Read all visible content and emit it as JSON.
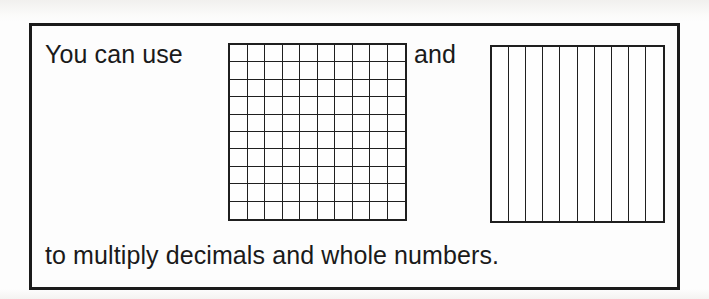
{
  "page": {
    "background_color": "#fdfdfd",
    "ink_color": "#1a1a1a"
  },
  "callout": {
    "border_color": "#1b1b1b",
    "line1": {
      "lead_text": "You can use",
      "conjunction_text": "and"
    },
    "line2": {
      "caption_text": "to multiply decimals and whole numbers."
    }
  },
  "figures": [
    {
      "name": "hundredths-grid",
      "description": "hundredths square model",
      "rows": 10,
      "columns": 10,
      "cells": 100,
      "stroke_color": "#1f1f1f",
      "fill_color": "#fefefe"
    },
    {
      "name": "tenths-grid",
      "description": "tenths strip model",
      "rows": 1,
      "columns": 10,
      "cells": 10,
      "stroke_color": "#1f1f1f",
      "fill_color": "#fefefe"
    }
  ]
}
